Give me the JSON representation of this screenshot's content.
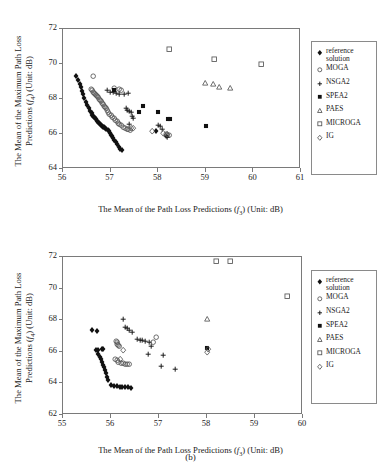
{
  "figure": {
    "caption": "(b)"
  },
  "legend": {
    "items": [
      {
        "label": "reference\nsolution",
        "marker": "filled-diamond",
        "name": "reference-solution"
      },
      {
        "label": "MOGA",
        "marker": "open-hexagon",
        "name": "moga"
      },
      {
        "label": "NSGA2",
        "marker": "plus",
        "name": "nsga2"
      },
      {
        "label": "SPEA2",
        "marker": "filled-square",
        "name": "spea2"
      },
      {
        "label": "PAES",
        "marker": "open-triangle",
        "name": "paes"
      },
      {
        "label": "MICROGA",
        "marker": "open-square",
        "name": "microga"
      },
      {
        "label": "IG",
        "marker": "open-diamond",
        "name": "ig"
      }
    ]
  },
  "chart_data": [
    {
      "id": "panel-a",
      "type": "scatter",
      "title": "",
      "xlabel": "The Mean of the Path Loss Predictions (f3) (Unit: dB)",
      "xlabel_parts": {
        "pre": "The Mean of the Path Loss Predictions (",
        "sym": "f",
        "subscript": "3",
        "post": ") (Unit: dB)"
      },
      "ylabel": "The Mean of the Maximum Path Loss Predictions (f4) (Unit: dB)",
      "ylabel_line1": "The Mean of the Maximum Path Loss",
      "ylabel_line2_parts": {
        "pre": "Predictions (",
        "sym": "f",
        "subscript": "4",
        "post": ") (Unit: dB)"
      },
      "xlim": [
        56,
        61
      ],
      "ylim": [
        64,
        72
      ],
      "xticks": [
        56,
        57,
        58,
        59,
        60,
        61
      ],
      "yticks": [
        64,
        66,
        68,
        70,
        72
      ],
      "grid": false,
      "legend_position": "right-outside",
      "series": [
        {
          "name": "reference solution",
          "marker": "filled-diamond",
          "points": [
            [
              56.3,
              69.25
            ],
            [
              56.34,
              69.02
            ],
            [
              56.37,
              68.8
            ],
            [
              56.4,
              68.62
            ],
            [
              56.42,
              68.42
            ],
            [
              56.45,
              68.22
            ],
            [
              56.47,
              67.98
            ],
            [
              56.5,
              67.8
            ],
            [
              56.53,
              67.62
            ],
            [
              56.56,
              67.42
            ],
            [
              56.59,
              67.28
            ],
            [
              56.62,
              67.15
            ],
            [
              56.64,
              67.05
            ],
            [
              56.66,
              66.97
            ],
            [
              56.68,
              66.9
            ],
            [
              56.7,
              66.84
            ],
            [
              56.72,
              66.78
            ],
            [
              56.74,
              66.71
            ],
            [
              56.76,
              66.65
            ],
            [
              56.78,
              66.58
            ],
            [
              56.8,
              66.52
            ],
            [
              56.82,
              66.46
            ],
            [
              56.84,
              66.4
            ],
            [
              56.86,
              66.36
            ],
            [
              56.88,
              66.32
            ],
            [
              56.9,
              66.28
            ],
            [
              56.93,
              66.22
            ],
            [
              56.96,
              66.16
            ],
            [
              56.98,
              66.1
            ],
            [
              57.0,
              66.0
            ],
            [
              57.02,
              65.9
            ],
            [
              57.04,
              65.82
            ],
            [
              57.07,
              65.72
            ],
            [
              57.1,
              65.6
            ],
            [
              57.13,
              65.48
            ],
            [
              57.16,
              65.36
            ],
            [
              57.19,
              65.22
            ],
            [
              57.22,
              65.1
            ],
            [
              57.25,
              65.02
            ],
            [
              57.98,
              66.12
            ]
          ]
        },
        {
          "name": "MOGA",
          "marker": "open-hexagon",
          "points": [
            [
              56.66,
              69.25
            ],
            [
              56.62,
              68.5
            ],
            [
              56.64,
              68.44
            ],
            [
              56.66,
              68.36
            ],
            [
              56.68,
              68.3
            ],
            [
              56.7,
              68.22
            ],
            [
              56.72,
              68.16
            ],
            [
              56.74,
              68.1
            ],
            [
              56.76,
              68.02
            ],
            [
              56.78,
              67.94
            ],
            [
              56.8,
              67.86
            ],
            [
              56.82,
              67.8
            ],
            [
              56.84,
              67.72
            ],
            [
              56.86,
              67.64
            ],
            [
              56.88,
              67.56
            ],
            [
              56.9,
              67.48
            ],
            [
              56.92,
              67.4
            ],
            [
              56.95,
              67.3
            ],
            [
              56.98,
              67.2
            ],
            [
              57.0,
              67.1
            ],
            [
              57.03,
              67.0
            ],
            [
              57.06,
              66.92
            ],
            [
              57.09,
              66.82
            ],
            [
              57.12,
              66.74
            ],
            [
              57.15,
              66.66
            ],
            [
              57.18,
              66.58
            ],
            [
              57.21,
              66.5
            ],
            [
              57.24,
              66.44
            ],
            [
              57.28,
              66.34
            ],
            [
              57.32,
              66.28
            ],
            [
              57.36,
              66.24
            ],
            [
              57.4,
              66.2
            ],
            [
              57.43,
              66.18
            ],
            [
              57.1,
              68.58
            ],
            [
              57.2,
              68.5
            ],
            [
              57.25,
              68.42
            ],
            [
              58.18,
              65.96
            ],
            [
              58.22,
              65.9
            ],
            [
              58.26,
              65.85
            ]
          ]
        },
        {
          "name": "NSGA2",
          "marker": "plus",
          "points": [
            [
              56.96,
              68.42
            ],
            [
              57.02,
              68.36
            ],
            [
              57.08,
              68.32
            ],
            [
              57.14,
              68.28
            ],
            [
              57.2,
              68.24
            ],
            [
              57.3,
              68.2
            ],
            [
              57.4,
              68.28
            ],
            [
              57.34,
              67.4
            ],
            [
              57.38,
              67.32
            ],
            [
              57.42,
              67.24
            ],
            [
              57.46,
              67.18
            ],
            [
              57.48,
              66.96
            ],
            [
              57.5,
              66.86
            ],
            [
              57.42,
              66.48
            ],
            [
              58.02,
              66.46
            ],
            [
              58.06,
              66.38
            ],
            [
              58.1,
              66.22
            ],
            [
              58.18,
              65.8
            ],
            [
              58.22,
              65.75
            ]
          ]
        },
        {
          "name": "SPEA2",
          "marker": "filled-square",
          "points": [
            [
              57.1,
              68.46
            ],
            [
              57.7,
              67.56
            ],
            [
              57.62,
              67.18
            ],
            [
              58.02,
              67.18
            ],
            [
              58.22,
              66.8
            ],
            [
              58.26,
              66.78
            ],
            [
              59.02,
              66.42
            ]
          ]
        },
        {
          "name": "PAES",
          "marker": "open-triangle",
          "points": [
            [
              59.0,
              68.84
            ],
            [
              59.18,
              68.78
            ],
            [
              59.3,
              68.62
            ],
            [
              59.54,
              68.56
            ]
          ]
        },
        {
          "name": "MICROGA",
          "marker": "open-square",
          "points": [
            [
              58.26,
              70.78
            ],
            [
              59.2,
              70.22
            ],
            [
              60.18,
              69.96
            ]
          ]
        },
        {
          "name": "IG",
          "marker": "open-diamond",
          "points": [
            [
              57.9,
              66.12
            ],
            [
              58.12,
              65.98
            ],
            [
              58.2,
              65.94
            ],
            [
              57.46,
              66.3
            ],
            [
              57.5,
              66.26
            ]
          ]
        }
      ]
    },
    {
      "id": "panel-b",
      "type": "scatter",
      "title": "",
      "xlabel": "The Mean of the Path Loss Predictions (f3) (Unit: dB)",
      "xlabel_parts": {
        "pre": "The Mean of the Path Loss Predictions (",
        "sym": "f",
        "subscript": "3",
        "post": ") (Unit: dB)"
      },
      "ylabel": "The Mean of the Maximum Path Loss Predictions (f4) (Unit: dB)",
      "ylabel_line1": "The Mean of the Maximum Path Loss",
      "ylabel_line2_parts": {
        "pre": "Predictions (",
        "sym": "f",
        "subscript": "4",
        "post": ") (Unit: dB)"
      },
      "xlim": [
        55,
        60
      ],
      "ylim": [
        62,
        72
      ],
      "xticks": [
        55,
        56,
        57,
        58,
        59,
        60
      ],
      "yticks": [
        62,
        64,
        66,
        68,
        70,
        72
      ],
      "grid": false,
      "legend_position": "right-outside",
      "series": [
        {
          "name": "reference solution",
          "marker": "filled-diamond",
          "points": [
            [
              55.62,
              67.3
            ],
            [
              55.72,
              67.28
            ],
            [
              55.7,
              66.08
            ],
            [
              55.74,
              66.02
            ],
            [
              55.76,
              65.82
            ],
            [
              55.8,
              65.62
            ],
            [
              55.82,
              65.46
            ],
            [
              55.84,
              65.3
            ],
            [
              55.86,
              65.12
            ],
            [
              55.88,
              64.96
            ],
            [
              55.9,
              64.78
            ],
            [
              55.92,
              64.58
            ],
            [
              55.94,
              64.36
            ],
            [
              55.96,
              64.14
            ],
            [
              56.02,
              63.86
            ],
            [
              56.08,
              63.8
            ],
            [
              56.14,
              63.76
            ],
            [
              56.2,
              63.74
            ],
            [
              56.26,
              63.72
            ],
            [
              56.32,
              63.7
            ],
            [
              56.38,
              63.68
            ],
            [
              56.44,
              63.66
            ],
            [
              55.84,
              66.14
            ],
            [
              55.86,
              66.1
            ]
          ]
        },
        {
          "name": "MOGA",
          "marker": "open-hexagon",
          "points": [
            [
              56.12,
              66.6
            ],
            [
              56.14,
              66.52
            ],
            [
              56.16,
              66.44
            ],
            [
              56.18,
              66.36
            ],
            [
              56.2,
              66.28
            ],
            [
              56.1,
              65.46
            ],
            [
              56.14,
              65.38
            ],
            [
              56.18,
              65.3
            ],
            [
              56.24,
              65.24
            ],
            [
              56.28,
              65.2
            ],
            [
              56.32,
              65.18
            ],
            [
              56.36,
              65.16
            ],
            [
              56.4,
              65.14
            ],
            [
              56.96,
              66.88
            ],
            [
              56.9,
              66.52
            ]
          ]
        },
        {
          "name": "NSGA2",
          "marker": "plus",
          "points": [
            [
              56.28,
              68.02
            ],
            [
              56.32,
              67.5
            ],
            [
              56.36,
              67.4
            ],
            [
              56.4,
              67.3
            ],
            [
              56.46,
              67.18
            ],
            [
              56.56,
              66.72
            ],
            [
              56.62,
              66.68
            ],
            [
              56.68,
              66.64
            ],
            [
              56.74,
              66.6
            ],
            [
              56.82,
              66.56
            ],
            [
              56.86,
              66.3
            ],
            [
              56.8,
              65.8
            ],
            [
              57.1,
              65.72
            ],
            [
              57.06,
              65.0
            ],
            [
              57.36,
              64.82
            ]
          ]
        },
        {
          "name": "SPEA2",
          "marker": "filled-square",
          "points": [
            [
              58.02,
              66.16
            ]
          ]
        },
        {
          "name": "PAES",
          "marker": "open-triangle",
          "points": [
            [
              58.02,
              68.02
            ]
          ]
        },
        {
          "name": "MICROGA",
          "marker": "open-square",
          "points": [
            [
              58.22,
              71.7
            ],
            [
              58.5,
              71.7
            ],
            [
              59.7,
              69.48
            ]
          ]
        },
        {
          "name": "IG",
          "marker": "open-diamond",
          "points": [
            [
              56.28,
              66.02
            ],
            [
              56.22,
              65.44
            ],
            [
              58.02,
              65.92
            ],
            [
              58.04,
              66.12
            ]
          ]
        }
      ]
    }
  ]
}
